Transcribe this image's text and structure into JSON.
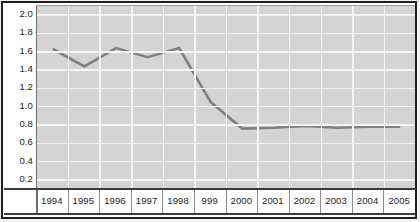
{
  "chart_data": {
    "type": "line",
    "title": "",
    "subtitle": "",
    "xlabel": "",
    "ylabel": "",
    "x": [
      "1994",
      "1995",
      "1996",
      "1997",
      "1998",
      "999",
      "2000",
      "2001",
      "2002",
      "2003",
      "2004",
      "2005"
    ],
    "categories": [
      "1994",
      "1995",
      "1996",
      "1997",
      "1998",
      "999",
      "2000",
      "2001",
      "2002",
      "2003",
      "2004",
      "2005"
    ],
    "values": [
      1.63,
      1.44,
      1.64,
      1.54,
      1.64,
      1.05,
      0.76,
      0.77,
      0.79,
      0.77,
      0.78,
      0.78
    ],
    "series": [
      {
        "name": "",
        "values": [
          1.63,
          1.44,
          1.64,
          1.54,
          1.64,
          1.05,
          0.76,
          0.77,
          0.79,
          0.77,
          0.78,
          0.78
        ]
      }
    ],
    "ylim": [
      0.1,
      2.1
    ],
    "ytick_labels": [
      "2.0",
      "1.8",
      "1.6",
      "1.4",
      "1.2",
      "1.0",
      "0.8",
      "0.6",
      "0.4",
      "0.2"
    ],
    "ytick_values": [
      2.0,
      1.8,
      1.6,
      1.4,
      1.2,
      1.0,
      0.8,
      0.6,
      0.4,
      0.2
    ],
    "grid": true,
    "legend": false,
    "legend_position": "none",
    "annotations": [],
    "colors": {
      "line": "#808080",
      "plot_background": "#d4d4d4",
      "gridline": "#f4f4f4",
      "frame": "#231f20",
      "figure_background": "#ffffff",
      "text": "#1a1a1a"
    }
  }
}
